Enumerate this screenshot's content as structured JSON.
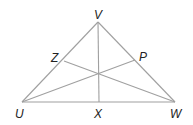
{
  "diagram": {
    "type": "triangle-with-cevians",
    "line_color": "#a0a0a0",
    "label_color": "#222222",
    "vertices": {
      "V": {
        "label": "V",
        "x": 98,
        "y": 22,
        "lx": 94,
        "ly": 19
      },
      "U": {
        "label": "U",
        "x": 22,
        "y": 102,
        "lx": 15,
        "ly": 118
      },
      "W": {
        "label": "W",
        "x": 175,
        "y": 102,
        "lx": 170,
        "ly": 118
      }
    },
    "points": {
      "Z": {
        "label": "Z",
        "x": 64,
        "y": 61,
        "lx": 51,
        "ly": 62
      },
      "P": {
        "label": "P",
        "x": 135,
        "y": 60,
        "lx": 139,
        "ly": 61
      },
      "X": {
        "label": "X",
        "x": 99,
        "y": 102,
        "lx": 94,
        "ly": 118
      }
    },
    "segments": [
      {
        "from": "U",
        "to": "V"
      },
      {
        "from": "V",
        "to": "W"
      },
      {
        "from": "U",
        "to": "W"
      },
      {
        "from": "V",
        "to": "X"
      },
      {
        "from": "U",
        "to": "P"
      },
      {
        "from": "W",
        "to": "Z"
      }
    ]
  }
}
